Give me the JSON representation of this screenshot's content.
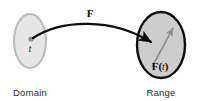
{
  "figure": {
    "kind": "function-mapping-diagram",
    "background_color": "#ffffff",
    "width": 198,
    "height": 101
  },
  "domain": {
    "caption": "Domain",
    "caption_x": 30,
    "caption_y": 95,
    "ellipse": {
      "name": "domain-ellipse",
      "cx": 30,
      "cy": 41,
      "rx": 16,
      "ry": 27,
      "fill_color": "#e6e6e6",
      "stroke_color": "#b9b9b9",
      "stroke_width": 2
    },
    "point": {
      "name": "domain-point",
      "label": "t",
      "cx": 31,
      "cy": 39,
      "r": 2.6,
      "color": "#8c8c8c",
      "label_x": 30,
      "label_y": 52
    }
  },
  "range": {
    "caption": "Range",
    "caption_x": 161,
    "caption_y": 95,
    "ellipse": {
      "name": "range-ellipse",
      "cx": 161,
      "cy": 45,
      "rx": 24,
      "ry": 33,
      "fill_color": "#cdcdcd",
      "stroke_color": "#0d0d0d",
      "stroke_width": 2.4
    },
    "vector": {
      "name": "range-vector-arrow",
      "label": "F(t)",
      "label_bold_part": "F",
      "label_italic_part": "t",
      "x1": 152,
      "y1": 67,
      "x2": 174,
      "y2": 26,
      "color": "#8f8f8f",
      "stroke_width": 1.6,
      "label_x": 160,
      "label_y": 70
    }
  },
  "mapping_arrow": {
    "name": "mapping-arrow",
    "label": "F",
    "label_x": 90,
    "label_y": 17,
    "color": "#0d0d0d",
    "stroke_width": 2.2,
    "path": "M 33 38 C 60 20, 110 18, 152 43",
    "arrow_tip_x": 152,
    "arrow_tip_y": 43
  },
  "colors": {
    "ink": "#0d0d0d",
    "caption": "#2b2b2b",
    "domain_fill": "#e6e6e6",
    "domain_stroke": "#b9b9b9",
    "range_fill": "#cdcdcd",
    "range_stroke": "#0d0d0d",
    "vector_gray": "#8f8f8f",
    "point_gray": "#8c8c8c"
  }
}
